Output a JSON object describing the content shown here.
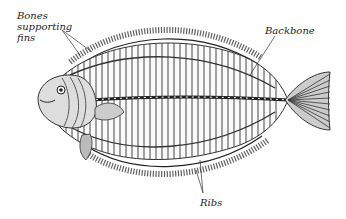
{
  "diagram": {
    "labels": [
      {
        "id": "bones-supporting-fins",
        "lines": [
          "Bones",
          "supporting",
          "fins"
        ]
      },
      {
        "id": "backbone",
        "text": "Backbone"
      },
      {
        "id": "ribs",
        "text": "Ribs"
      }
    ],
    "colors": {
      "ink": "#2a2a2a",
      "background": "#ffffff"
    }
  }
}
